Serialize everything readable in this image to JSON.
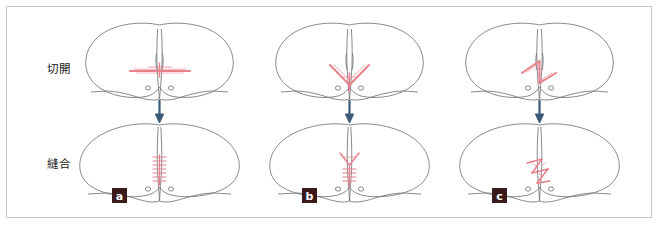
{
  "figure": {
    "frame_border_color": "#c9c9c9",
    "background_color": "#ffffff",
    "row_labels": {
      "incision": "切開",
      "suture": "縫合"
    },
    "colors": {
      "anatomy_outline": "#6b6b72",
      "incision_red": "#e8808a",
      "suture_red": "#e8808a",
      "arrow_blue": "#3c5a78",
      "badge_background": "#3b1a1c",
      "badge_text": "#ffffff"
    },
    "panels": [
      {
        "badge": "a",
        "technique_name": "linear-transverse",
        "top_marking": "horizontal-incision-line",
        "bottom_marking": "vertical-ladder-suture"
      },
      {
        "badge": "b",
        "technique_name": "v-y-plasty",
        "top_marking": "v-shaped-incision",
        "bottom_marking": "y-shaped-suture-with-ladder"
      },
      {
        "badge": "c",
        "technique_name": "z-plasty",
        "top_marking": "z-shaped-incision",
        "bottom_marking": "z-shaped-suture"
      }
    ],
    "arrow": {
      "direction": "down",
      "count": 3
    },
    "anatomy": {
      "gland_marks": 2,
      "shape_top": "two-round-lobes-with-central-cleft",
      "shape_bottom": "wide-flattened-lobes-with-central-cleft"
    }
  }
}
